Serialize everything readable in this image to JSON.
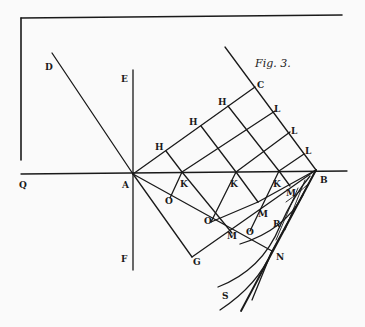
{
  "figure": {
    "title": "Fig. 3.",
    "colors": {
      "ink": "#1a1a1a",
      "paper": "#fafafa"
    }
  },
  "labels": {
    "D": "D",
    "E": "E",
    "C": "C",
    "Q": "Q",
    "A": "A",
    "B": "B",
    "F": "F",
    "G": "G",
    "N": "N",
    "S": "S",
    "H1": "H",
    "H2": "H",
    "H3": "H",
    "L1": "L",
    "L2": "L",
    "L3": "L",
    "K1": "K",
    "K2": "K",
    "K3": "K",
    "O1": "O",
    "O2": "O",
    "O3": "O",
    "M1": "M",
    "M2": "M",
    "M3": "M",
    "R": "R"
  }
}
